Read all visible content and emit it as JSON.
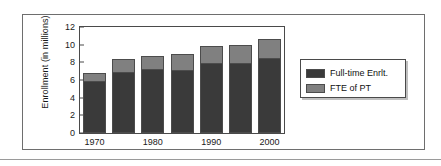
{
  "chart_data": {
    "type": "bar",
    "subtype": "stacked-vertical",
    "title": "",
    "xlabel": "",
    "ylabel": "Enrollment (in millions)",
    "ylim": [
      0,
      12
    ],
    "yticks": [
      0,
      2,
      4,
      6,
      8,
      10,
      12
    ],
    "ytick_labels": [
      "0",
      "2",
      "4",
      "6",
      "8",
      "10",
      "12"
    ],
    "grid": false,
    "legend_position": "right",
    "categories": [
      "1970",
      "1975",
      "1980",
      "1985",
      "1990",
      "1995",
      "2000"
    ],
    "visible_tick_labels": [
      "1970",
      "1980",
      "1990",
      "2000"
    ],
    "visible_tick_label_indices": [
      0,
      2,
      4,
      6
    ],
    "series": [
      {
        "name": "Full-time Enrlt.",
        "color": "#3a3a3a",
        "values": [
          5.8,
          6.85,
          7.1,
          7.0,
          7.8,
          7.8,
          8.35
        ]
      },
      {
        "name": "FTE of PT",
        "color": "#808080",
        "values": [
          0.95,
          1.55,
          1.65,
          1.9,
          2.1,
          2.2,
          2.35
        ]
      }
    ],
    "totals": [
      6.75,
      8.4,
      8.75,
      8.9,
      9.9,
      10.0,
      10.7
    ]
  },
  "legend": {
    "entries": [
      {
        "label": "Full-time Enrlt.",
        "color": "#3a3a3a"
      },
      {
        "label": "FTE of PT",
        "color": "#808080"
      }
    ]
  },
  "colors": {
    "full_time": "#3a3a3a",
    "fte_part_time": "#808080",
    "frame": "#4a4a4a",
    "outer_frame": "#6e6e6e",
    "text": "#1a1a1a",
    "background": "#ffffff"
  }
}
